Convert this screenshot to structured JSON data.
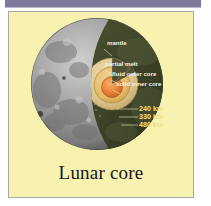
{
  "page": {
    "background_color": "#ffffff"
  },
  "top_bar": {
    "name": "decorative-top-bar",
    "color": "#7d7a9e"
  },
  "figure": {
    "panel_background": "#f7f2b0",
    "panel_border_color": "#a9a9a9",
    "caption": "Lunar core",
    "diagram_type": "cutaway-cross-section",
    "moon_surface_color": "#8d8d8d",
    "cutaway_face_color": "#3b4028",
    "labels": [
      {
        "id": "mantle",
        "text": "mantle",
        "color": "#f4f2e2"
      },
      {
        "id": "partial-melt",
        "text": "partial melt",
        "color": "#f4f2e2"
      },
      {
        "id": "fluid-outer-core",
        "text": "fluid outer core",
        "color": "#f4f2e2"
      },
      {
        "id": "solid-inner-core",
        "text": "solid inner core",
        "color": "#f4f2e2"
      }
    ],
    "depth_labels": [
      {
        "id": "depth-240",
        "text": "240 km",
        "color": "#f2e27a"
      },
      {
        "id": "depth-330",
        "text": "330 km",
        "color": "#f2e27a"
      },
      {
        "id": "depth-480",
        "text": "480 km",
        "color": "#f2e27a"
      }
    ],
    "layers": [
      {
        "id": "mantle",
        "label": "mantle",
        "color": "#3b4028"
      },
      {
        "id": "partial-melt",
        "label": "partial melt",
        "color": "#ddc890"
      },
      {
        "id": "fluid-outer-core",
        "label": "fluid outer core",
        "color": "#e8c173"
      },
      {
        "id": "solid-inner-core",
        "label": "solid inner core",
        "color": "#e8803a"
      }
    ]
  }
}
